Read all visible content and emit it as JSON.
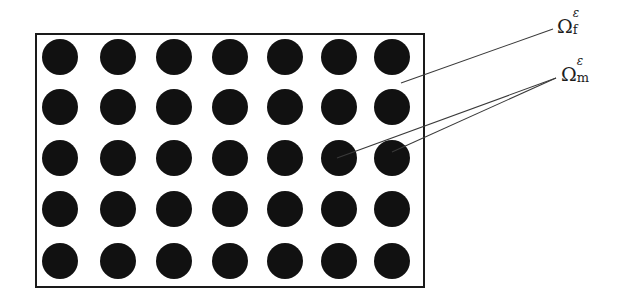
{
  "figure": {
    "type": "schematic-diagram",
    "canvas": {
      "width": 620,
      "height": 306
    },
    "colors": {
      "background": "#ffffff",
      "inclusion_fill": "#111111",
      "border": "#1a1a1a",
      "leader_line": "#3a3a3a",
      "label_text": "#1d1d1d"
    }
  },
  "domain_rect": {
    "name": "composite-domain-boundary",
    "x": 35,
    "y": 33,
    "width": 390,
    "height": 255,
    "border_width": 2
  },
  "inclusions": {
    "shape": "circle",
    "columns": 7,
    "rows": 5,
    "count": 35,
    "diameter": 36,
    "column_centers": [
      58,
      116,
      172,
      228,
      283,
      337,
      390
    ],
    "row_centers": [
      55,
      105,
      156,
      207,
      259
    ]
  },
  "labels": [
    {
      "id": "omega-f",
      "symbol": "Ω",
      "superscript": "ε",
      "subscript": "f",
      "reading": "Omega superscript epsilon subscript f",
      "meaning": "fiber / inclusion phase",
      "x": 557,
      "y": 14
    },
    {
      "id": "omega-m",
      "symbol": "Ω",
      "superscript": "ε",
      "subscript": "m",
      "reading": "Omega superscript epsilon subscript m",
      "meaning": "matrix phase",
      "x": 561,
      "y": 62
    }
  ],
  "leader_lines": [
    {
      "id": "leader-omega-f",
      "from_label": "omega-f",
      "x1": 553,
      "y1": 29,
      "x2": 401,
      "y2": 83
    },
    {
      "id": "leader-omega-m-1",
      "from_label": "omega-m",
      "x1": 556,
      "y1": 78,
      "x2": 392,
      "y2": 152
    },
    {
      "id": "leader-omega-m-2",
      "from_label": "omega-m",
      "x1": 556,
      "y1": 78,
      "x2": 337,
      "y2": 158
    }
  ]
}
